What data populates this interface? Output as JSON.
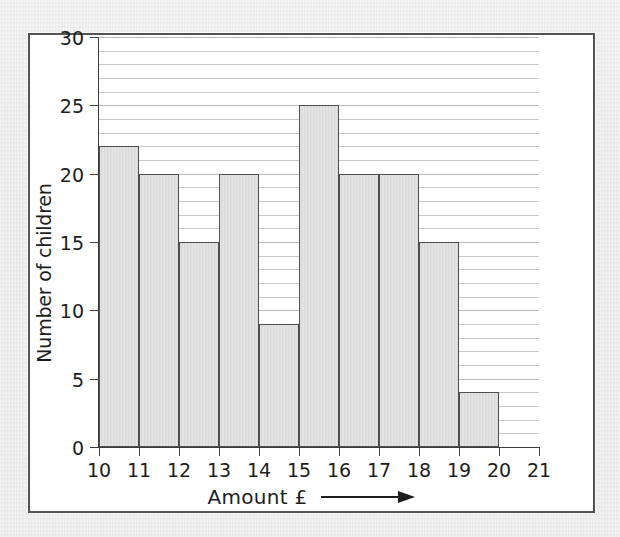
{
  "page": {
    "background_color": "#e9e9e9",
    "clipped_caption": "' '"
  },
  "figure": {
    "frame_border_color": "#545454",
    "plot_background": "#ffffff",
    "bar_fill_color": "#dcdcdc",
    "bar_border_color": "#4f4f4f",
    "gridline_color": "#b9b9b9",
    "axis_color": "#3c3c3c"
  },
  "axes": {
    "y_title": "Number of children",
    "x_title": "Amount £",
    "x_arrow_icon": "right-arrow-icon",
    "y_tick_labels": [
      "0",
      "5",
      "10",
      "15",
      "20",
      "25",
      "30"
    ],
    "x_tick_labels": [
      "10",
      "11",
      "12",
      "13",
      "14",
      "15",
      "16",
      "17",
      "18",
      "19",
      "20",
      "21"
    ]
  },
  "chart_data": {
    "type": "bar",
    "title": "",
    "subtitle": "",
    "xlabel": "Amount £",
    "ylabel": "Number of children",
    "xlim": [
      10,
      21
    ],
    "ylim": [
      0,
      30
    ],
    "y_major_step": 5,
    "y_minor_step": 1,
    "grid": true,
    "grid_axis": "y",
    "legend": false,
    "legend_position": "none",
    "bin_edges": [
      10,
      11,
      12,
      13,
      14,
      15,
      16,
      17,
      18,
      19,
      20,
      21
    ],
    "bin_labels": [
      "10-11",
      "11-12",
      "12-13",
      "13-14",
      "14-15",
      "15-16",
      "16-17",
      "17-18",
      "18-19",
      "19-20",
      "20-21"
    ],
    "categories": [
      "10",
      "11",
      "12",
      "13",
      "14",
      "15",
      "16",
      "17",
      "18",
      "19",
      "20"
    ],
    "values": [
      22,
      20,
      15,
      20,
      9,
      25,
      20,
      20,
      15,
      4,
      0
    ],
    "series": [
      {
        "name": "Number of children",
        "values": [
          22,
          20,
          15,
          20,
          9,
          25,
          20,
          20,
          15,
          4,
          0
        ]
      }
    ],
    "annotations": []
  }
}
